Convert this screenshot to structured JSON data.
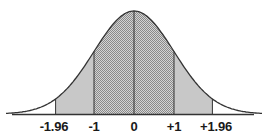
{
  "chart_data": {
    "type": "area",
    "title": "",
    "xlabel": "",
    "ylabel": "",
    "tick_labels": [
      "-1.96",
      "-1",
      "0",
      "+1",
      "+1.96"
    ],
    "tick_values": [
      -1.96,
      -1,
      0,
      1,
      1.96
    ],
    "regions": [
      {
        "name": "inner",
        "from": -1,
        "to": 1,
        "fill": "dotted-gray",
        "color": "#bdbdbd"
      },
      {
        "name": "outer-left",
        "from": -1.96,
        "to": -1,
        "fill": "solid-light-gray",
        "color": "#c8c8c8"
      },
      {
        "name": "outer-right",
        "from": 1,
        "to": 1.96,
        "fill": "solid-light-gray",
        "color": "#c8c8c8"
      },
      {
        "name": "tail-left",
        "from": -3.2,
        "to": -1.96,
        "fill": "none"
      },
      {
        "name": "tail-right",
        "from": 1.96,
        "to": 3.2,
        "fill": "none"
      }
    ],
    "xlim": [
      -3.2,
      3.2
    ],
    "grid": false,
    "legend": "none",
    "curve_color": "#333333",
    "axis_color": "#333333"
  },
  "labels": {
    "t0": "-1.96",
    "t1": "-1",
    "t2": "0",
    "t3": "+1",
    "t4": "+1.96"
  }
}
